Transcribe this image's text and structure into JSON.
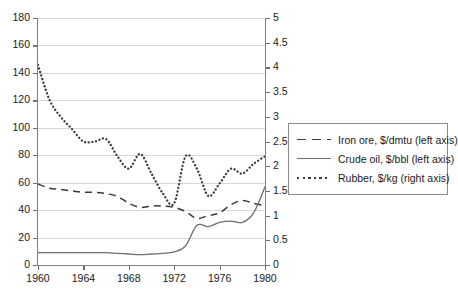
{
  "chart_data": {
    "type": "line",
    "title": "",
    "xlabel": "",
    "ylabel_left": "",
    "ylabel_right": "",
    "xlim": [
      1960,
      1980
    ],
    "xticks": [
      "1960",
      "1964",
      "1968",
      "1972",
      "1976",
      "1980"
    ],
    "xtick_values": [
      1960,
      1964,
      1968,
      1972,
      1976,
      1980
    ],
    "ylim_left": [
      0,
      180
    ],
    "yticks_left": [
      "0",
      "20",
      "40",
      "60",
      "80",
      "100",
      "120",
      "140",
      "160",
      "180"
    ],
    "ytick_values_left": [
      0,
      20,
      40,
      60,
      80,
      100,
      120,
      140,
      160,
      180
    ],
    "ylim_right": [
      0,
      5
    ],
    "yticks_right": [
      "0",
      "0.5",
      "1",
      "1.5",
      "2",
      "2.5",
      "3",
      "3.5",
      "4",
      "4.5",
      "5"
    ],
    "ytick_values_right": [
      0,
      0.5,
      1,
      1.5,
      2,
      2.5,
      3,
      3.5,
      4,
      4.5,
      5
    ],
    "grid": true,
    "legend_position": "right",
    "x": [
      1960,
      1961,
      1962,
      1963,
      1964,
      1965,
      1966,
      1967,
      1968,
      1969,
      1970,
      1971,
      1972,
      1973,
      1974,
      1975,
      1976,
      1977,
      1978,
      1979,
      1980
    ],
    "series": [
      {
        "name": "Iron ore, $/dmtu (left axis)",
        "axis": "left",
        "style": "dashed",
        "color": "#3a3a3a",
        "values": [
          59,
          56,
          55,
          54,
          53,
          53,
          52,
          50,
          45,
          42,
          43,
          43,
          42,
          39,
          34,
          36,
          38,
          44,
          47,
          45,
          43
        ]
      },
      {
        "name": "Crude oil, $/bbl (left axis)",
        "axis": "left",
        "style": "solid",
        "color": "#6e6e6e",
        "values": [
          9,
          9,
          9,
          9,
          9,
          9,
          9,
          8.5,
          8,
          7.5,
          8,
          8.5,
          9.5,
          14,
          29,
          28,
          31,
          32,
          31,
          38,
          57
        ]
      },
      {
        "name": "Rubber, $/kg (right axis)",
        "axis": "right",
        "style": "dotted",
        "color": "#3a3a3a",
        "values": [
          4.05,
          3.35,
          3.0,
          2.75,
          2.5,
          2.5,
          2.55,
          2.2,
          1.95,
          2.25,
          1.85,
          1.45,
          1.25,
          2.2,
          1.95,
          1.4,
          1.65,
          1.95,
          1.85,
          2.05,
          2.2
        ]
      }
    ]
  },
  "legend": {
    "items": [
      {
        "label": "Iron ore, $/dmtu (left axis)",
        "style": "dashed"
      },
      {
        "label": "Crude oil, $/bbl (left axis)",
        "style": "solid"
      },
      {
        "label": "Rubber, $/kg (right axis)",
        "style": "dotted"
      }
    ]
  }
}
